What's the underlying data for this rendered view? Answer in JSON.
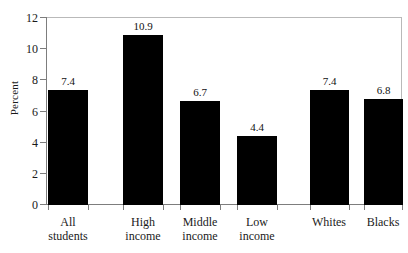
{
  "chart_data": {
    "type": "bar",
    "title": "",
    "xlabel": "",
    "ylabel": "Percent",
    "ylim": [
      0,
      12
    ],
    "yticks": [
      0,
      2,
      4,
      6,
      8,
      10,
      12
    ],
    "ytick_labels": [
      "0",
      "2",
      "4",
      "6",
      "8",
      "10",
      "12"
    ],
    "grid": false,
    "legend": "none",
    "bar_color": "#000000",
    "axis_color": "#7d7d7d",
    "categories": [
      "All students",
      "High income",
      "Middle income",
      "Low income",
      "Whites",
      "Blacks"
    ],
    "category_lines": [
      [
        "All",
        "students"
      ],
      [
        "High",
        "income"
      ],
      [
        "Middle",
        "income"
      ],
      [
        "Low",
        "income"
      ],
      [
        "Whites",
        ""
      ],
      [
        "Blacks",
        ""
      ]
    ],
    "values": [
      7.4,
      10.9,
      6.7,
      4.4,
      7.4,
      6.8
    ],
    "value_labels": [
      "7.4",
      "10.9",
      "6.7",
      "4.4",
      "7.4",
      "6.8"
    ],
    "groups": [
      {
        "name": "overall",
        "categories": [
          "All students"
        ]
      },
      {
        "name": "income",
        "categories": [
          "High income",
          "Middle income",
          "Low income"
        ]
      },
      {
        "name": "race",
        "categories": [
          "Whites",
          "Blacks"
        ]
      }
    ]
  },
  "bars": [
    {
      "label": "All students",
      "value_label": "7.4",
      "value": 7.4,
      "x": 48,
      "width": 40
    },
    {
      "label": "High income",
      "value_label": "10.9",
      "value": 10.9,
      "x": 123,
      "width": 40
    },
    {
      "label": "Middle income",
      "value_label": "6.7",
      "value": 6.7,
      "x": 180,
      "width": 40
    },
    {
      "label": "Low income",
      "value_label": "4.4",
      "value": 4.4,
      "x": 237,
      "width": 40
    },
    {
      "label": "Whites",
      "value_label": "7.4",
      "value": 7.4,
      "x": 310,
      "width": 39
    },
    {
      "label": "Blacks",
      "value_label": "6.8",
      "value": 6.8,
      "x": 364,
      "width": 39
    }
  ],
  "y_axis": {
    "title": "Percent",
    "ticks": [
      {
        "label": "12",
        "value": 12
      },
      {
        "label": "10",
        "value": 10
      },
      {
        "label": "8",
        "value": 8
      },
      {
        "label": "6",
        "value": 6
      },
      {
        "label": "4",
        "value": 4
      },
      {
        "label": "2",
        "value": 2
      },
      {
        "label": "0",
        "value": 0
      }
    ]
  }
}
